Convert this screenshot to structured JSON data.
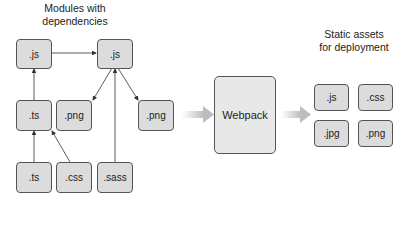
{
  "left_section": {
    "title_line1": "Modules with",
    "title_line2": "dependencies",
    "modules": [
      {
        "label": ".js"
      },
      {
        "label": ".js"
      },
      {
        "label": ".ts"
      },
      {
        "label": ".png"
      },
      {
        "label": ".png"
      },
      {
        "label": ".ts"
      },
      {
        "label": ".css"
      },
      {
        "label": ".sass"
      }
    ]
  },
  "center": {
    "label": "Webpack"
  },
  "right_section": {
    "title_line1": "Static assets",
    "title_line2": "for deployment",
    "assets": [
      {
        "label": ".js"
      },
      {
        "label": ".css"
      },
      {
        "label": ".jpg"
      },
      {
        "label": ".png"
      }
    ]
  },
  "colors": {
    "box_fill": "#dcdcdc",
    "box_border": "#555555",
    "arrow": "#333333",
    "flow_arrow": "#c8c8c8"
  }
}
